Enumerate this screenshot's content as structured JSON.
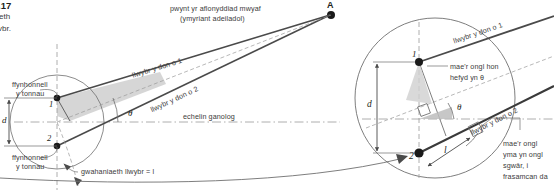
{
  "figure": {
    "id": "diagram-two-source-interference",
    "language": "cy",
    "caption_fragment_number": ".17",
    "margin_text_line1": "eth",
    "margin_text_line2": "vbr."
  },
  "main_diagram": {
    "point_a_label": "A",
    "max_disturbance_label_line1": "pwynt yr aflonyddiad mwyaf",
    "max_disturbance_label_line2": "(ymyriant adeiladol)",
    "wave_path_1_label": "llwybr y don o 1",
    "wave_path_2_label": "llwybr y don o 2",
    "central_axis_label": "echelin ganolog",
    "source_1_label_line1": "ffynhonnell",
    "source_1_label_line2": "y tonnau",
    "source_2_label_line1": "ffynhonnell",
    "source_2_label_line2": "y tonnau",
    "source_1_number": "1",
    "source_2_number": "2",
    "separation_label": "d",
    "angle_label": "θ",
    "path_difference_label": "gwahaniaeth llwybr = l"
  },
  "magnified_detail": {
    "source_1_number": "1",
    "source_2_number": "2",
    "separation_label": "d",
    "angle_label": "θ",
    "path_length_label": "l",
    "wave_path_1_label": "llwybr y don o 1",
    "wave_path_2_label": "llwybr y don o 2",
    "angle_note_line1": "mae'r ongl hon",
    "angle_note_line2": "hefyd yn θ",
    "right_angle_note_line1": "mae'r ongl",
    "right_angle_note_line2": "yma yn ongl",
    "right_angle_note_line3": "sgwâr, i",
    "right_angle_note_line4": "frasamcan da"
  },
  "colors": {
    "ink": "#231f20",
    "label_gray": "#3b3b3b",
    "line_gray": "#6f6f6f",
    "light_gray": "#9a9a9a",
    "shade_fill": "#cfcfcf",
    "background": "#ffffff"
  }
}
